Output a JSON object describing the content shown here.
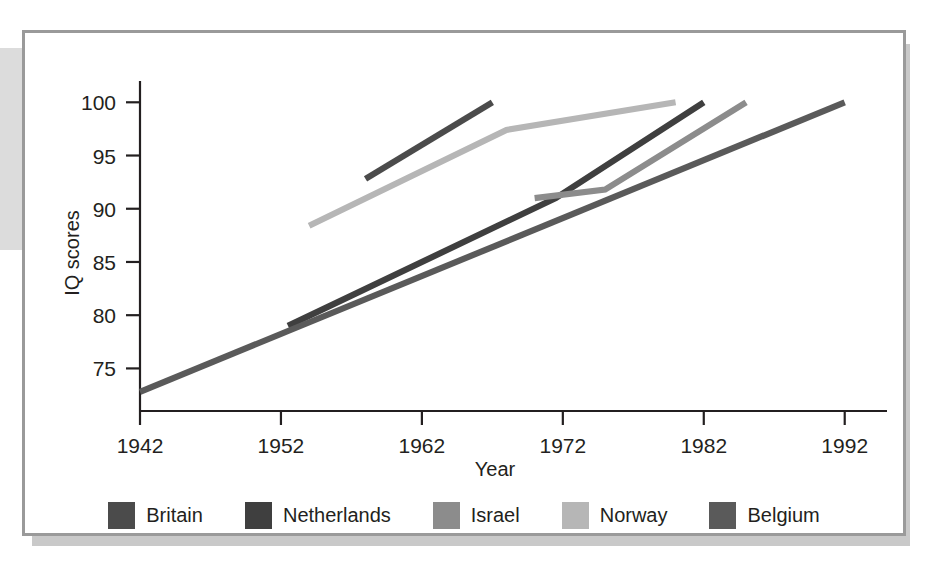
{
  "chart_data": {
    "type": "line",
    "title": "",
    "xlabel": "Year",
    "ylabel": "IQ scores",
    "xlim": [
      1942,
      1995
    ],
    "ylim": [
      71,
      102
    ],
    "grid": false,
    "legend_position": "bottom",
    "xticks": [
      "1942",
      "1952",
      "1962",
      "1972",
      "1982",
      "1992"
    ],
    "xtick_values": [
      1942,
      1952,
      1962,
      1972,
      1982,
      1992
    ],
    "yticks": [
      "75",
      "80",
      "85",
      "90",
      "95",
      "100"
    ],
    "ytick_values": [
      75,
      80,
      85,
      90,
      95,
      100
    ],
    "series": [
      {
        "name": "Britain",
        "color": "#4b4b4b",
        "x": [
          1958,
          1967
        ],
        "y": [
          92.8,
          100.0
        ]
      },
      {
        "name": "Netherlands",
        "color": "#3f3f3f",
        "x": [
          1952.5,
          1971.5,
          1982
        ],
        "y": [
          79.0,
          91.0,
          100.0
        ]
      },
      {
        "name": "Israel",
        "color": "#8c8c8c",
        "x": [
          1970.0,
          1975.0,
          1985.0
        ],
        "y": [
          91.0,
          91.8,
          100.0
        ]
      },
      {
        "name": "Norway",
        "color": "#b6b6b6",
        "x": [
          1954.0,
          1968.0,
          1980.0
        ],
        "y": [
          88.4,
          97.4,
          100.0
        ]
      },
      {
        "name": "Belgium",
        "color": "#5a5a5a",
        "x": [
          1942,
          1992
        ],
        "y": [
          72.8,
          100.0
        ]
      }
    ],
    "legend": [
      {
        "label": "Britain",
        "color": "#4b4b4b"
      },
      {
        "label": "Netherlands",
        "color": "#3f3f3f"
      },
      {
        "label": "Israel",
        "color": "#8c8c8c"
      },
      {
        "label": "Norway",
        "color": "#b6b6b6"
      },
      {
        "label": "Belgium",
        "color": "#5a5a5a"
      }
    ]
  }
}
